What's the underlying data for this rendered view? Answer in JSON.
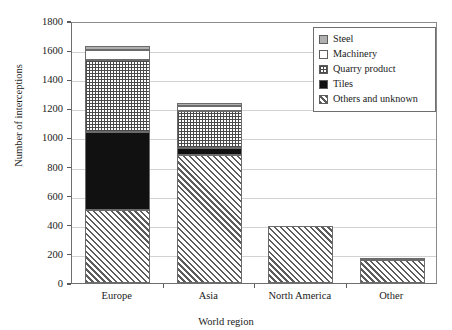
{
  "chart_data": {
    "type": "bar",
    "stacked": true,
    "title": "",
    "xlabel": "World region",
    "ylabel": "Number of interceptions",
    "categories": [
      "Europe",
      "Asia",
      "North America",
      "Other"
    ],
    "ylim": [
      0,
      1800
    ],
    "yticks": [
      0,
      200,
      400,
      600,
      800,
      1000,
      1200,
      1400,
      1600,
      1800
    ],
    "ytick_labels": [
      "0",
      "200",
      "400",
      "600",
      "800",
      "1000",
      "1200",
      "1400",
      "1600",
      "1800"
    ],
    "grid": true,
    "legend_position": "top-right",
    "series": [
      {
        "name": "Others and unknown",
        "swatch": "diagonal-hatch",
        "color": "#ffffff",
        "values": [
          500,
          880,
          390,
          155
        ]
      },
      {
        "name": "Tiles",
        "swatch": "solid-black",
        "color": "#111111",
        "values": [
          540,
          50,
          0,
          0
        ]
      },
      {
        "name": "Quarry product",
        "swatch": "grid-hatch",
        "color": "#ffffff",
        "values": [
          490,
          250,
          0,
          20
        ]
      },
      {
        "name": "Machinery",
        "swatch": "white",
        "color": "#ffffff",
        "values": [
          70,
          35,
          0,
          0
        ]
      },
      {
        "name": "Steel",
        "swatch": "solid-gray",
        "color": "#b0b0b0",
        "values": [
          30,
          25,
          0,
          0
        ]
      }
    ],
    "totals": [
      1630,
      1240,
      390,
      175
    ],
    "legend_order": [
      "Steel",
      "Machinery",
      "Quarry product",
      "Tiles",
      "Others and unknown"
    ]
  },
  "legend": {
    "items": [
      {
        "label": "Steel",
        "swatch": "solid-gray"
      },
      {
        "label": "Machinery",
        "swatch": "white"
      },
      {
        "label": "Quarry product",
        "swatch": "grid-hatch"
      },
      {
        "label": "Tiles",
        "swatch": "solid-black"
      },
      {
        "label": "Others and unknown",
        "swatch": "diagonal-hatch"
      }
    ]
  },
  "axes": {
    "y_title": "Number of interceptions",
    "x_title": "World region"
  }
}
